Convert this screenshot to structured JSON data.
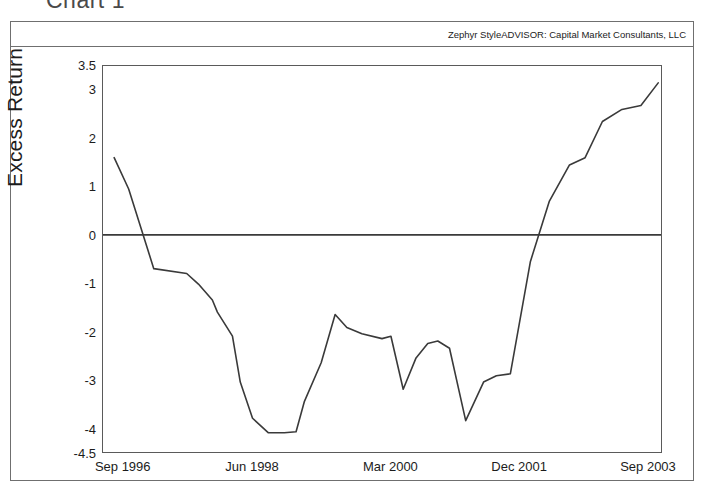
{
  "page": {
    "title": "Chart 1"
  },
  "chart_frame": {
    "source_note": "Zephyr StyleADVISOR: Capital Market Consultants, LLC"
  },
  "chart_data": {
    "type": "line",
    "title": "Chart 1",
    "subtitle": "Zephyr StyleADVISOR: Capital Market Consultants, LLC",
    "xlabel": "",
    "ylabel": "Excess Return",
    "grid": false,
    "legend": null,
    "zero_line": 0,
    "ylim": [
      -4.5,
      3.5
    ],
    "yticks": [
      3.5,
      3,
      2,
      1,
      0,
      -1,
      -2,
      -3,
      -4,
      -4.5
    ],
    "ytick_labels": [
      "3.5",
      "3",
      "2",
      "1",
      "0",
      "-1",
      "-2",
      "-3",
      "-4",
      "-4.5"
    ],
    "xtick_labels": [
      "Sep 1996",
      "Jun 1998",
      "Mar 2000",
      "Dec 2001",
      "Sep 2003"
    ],
    "xtick_positions": [
      0.037,
      0.268,
      0.515,
      0.745,
      0.975
    ],
    "xlim_labels": [
      "Sep 1996",
      "Sep 2003"
    ],
    "series": [
      {
        "name": "Excess Return",
        "color": "#3a3a3a",
        "x": [
          0.02,
          0.046,
          0.091,
          0.15,
          0.171,
          0.196,
          0.205,
          0.232,
          0.246,
          0.268,
          0.296,
          0.325,
          0.346,
          0.361,
          0.391,
          0.416,
          0.437,
          0.464,
          0.5,
          0.516,
          0.538,
          0.561,
          0.582,
          0.6,
          0.621,
          0.65,
          0.682,
          0.705,
          0.73,
          0.766,
          0.8,
          0.836,
          0.864,
          0.895,
          0.93,
          0.964,
          0.995
        ],
        "y": [
          1.6,
          0.95,
          -0.7,
          -0.8,
          -1.02,
          -1.35,
          -1.6,
          -2.1,
          -3.05,
          -3.8,
          -4.1,
          -4.1,
          -4.08,
          -3.45,
          -2.65,
          -1.65,
          -1.92,
          -2.05,
          -2.15,
          -2.1,
          -3.2,
          -2.55,
          -2.25,
          -2.2,
          -2.35,
          -3.85,
          -3.05,
          -2.92,
          -2.88,
          -0.55,
          0.7,
          1.45,
          1.6,
          2.35,
          2.6,
          2.68,
          3.15
        ],
        "y_tail_x": [
          0.995,
          0.83,
          0.885,
          0.93,
          0.975
        ],
        "note": "values read off axis; monthly-ish rolling excess return series"
      }
    ],
    "data_points": [
      {
        "x": 0.02,
        "y": 1.6
      },
      {
        "x": 0.046,
        "y": 0.95
      },
      {
        "x": 0.091,
        "y": -0.7
      },
      {
        "x": 0.15,
        "y": -0.8
      },
      {
        "x": 0.171,
        "y": -1.02
      },
      {
        "x": 0.205,
        "y": -1.6
      },
      {
        "x": 0.232,
        "y": -2.1
      },
      {
        "x": 0.246,
        "y": -3.05
      },
      {
        "x": 0.268,
        "y": -3.8
      },
      {
        "x": 0.296,
        "y": -4.1
      },
      {
        "x": 0.33,
        "y": -4.08
      },
      {
        "x": 0.361,
        "y": -3.45
      },
      {
        "x": 0.391,
        "y": -2.65
      },
      {
        "x": 0.416,
        "y": -1.65
      },
      {
        "x": 0.437,
        "y": -1.92
      },
      {
        "x": 0.464,
        "y": -2.05
      },
      {
        "x": 0.5,
        "y": -2.15
      },
      {
        "x": 0.516,
        "y": -2.1
      },
      {
        "x": 0.538,
        "y": -3.2
      },
      {
        "x": 0.561,
        "y": -2.55
      },
      {
        "x": 0.582,
        "y": -2.25
      },
      {
        "x": 0.6,
        "y": -2.2
      },
      {
        "x": 0.621,
        "y": -2.35
      },
      {
        "x": 0.65,
        "y": -3.85
      },
      {
        "x": 0.682,
        "y": -3.05
      },
      {
        "x": 0.705,
        "y": -2.92
      },
      {
        "x": 0.73,
        "y": -2.88
      },
      {
        "x": 0.766,
        "y": -0.55
      },
      {
        "x": 0.8,
        "y": 0.7
      },
      {
        "x": 0.836,
        "y": 1.45
      },
      {
        "x": 0.864,
        "y": 1.6
      },
      {
        "x": 0.895,
        "y": 2.35
      },
      {
        "x": 0.93,
        "y": 2.6
      },
      {
        "x": 0.964,
        "y": 2.68
      },
      {
        "x": 0.995,
        "y": 3.15
      }
    ]
  }
}
